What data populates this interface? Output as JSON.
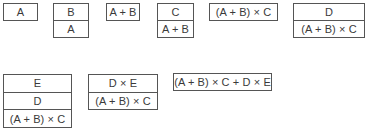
{
  "diagram": {
    "stacks": [
      {
        "id": "s1",
        "cells": [
          "A"
        ],
        "left": 3,
        "top": 3,
        "width": 35,
        "height": 18
      },
      {
        "id": "s2",
        "cells": [
          "B",
          "A"
        ],
        "left": 53,
        "top": 3,
        "width": 36,
        "height": 35
      },
      {
        "id": "s3",
        "cells": [
          "A + B"
        ],
        "left": 106,
        "top": 3,
        "width": 34,
        "height": 18
      },
      {
        "id": "s4",
        "cells": [
          "C",
          "A + B"
        ],
        "left": 157,
        "top": 3,
        "width": 37,
        "height": 35
      },
      {
        "id": "s5",
        "cells": [
          "(A + B) × C"
        ],
        "left": 209,
        "top": 3,
        "width": 69,
        "height": 18
      },
      {
        "id": "s6",
        "cells": [
          "D",
          "(A + B) × C"
        ],
        "left": 293,
        "top": 3,
        "width": 72,
        "height": 35
      },
      {
        "id": "s7",
        "cells": [
          "E",
          "D",
          "(A + B) × C"
        ],
        "left": 3,
        "top": 74,
        "width": 69,
        "height": 54
      },
      {
        "id": "s8",
        "cells": [
          "D × E",
          "(A + B) × C"
        ],
        "left": 88,
        "top": 74,
        "width": 70,
        "height": 36
      },
      {
        "id": "s9",
        "cells": [
          "(A + B) × C + D × E"
        ],
        "left": 173,
        "top": 73,
        "width": 99,
        "height": 18
      }
    ]
  }
}
